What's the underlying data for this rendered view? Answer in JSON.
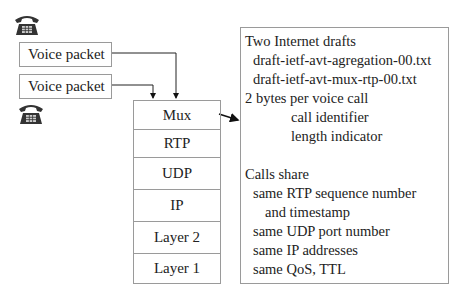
{
  "packets": [
    {
      "label": "Voice packet"
    },
    {
      "label": "Voice packet"
    }
  ],
  "phones": [
    {
      "icon": "telephone-icon"
    },
    {
      "icon": "telephone-icon"
    }
  ],
  "stack": {
    "layers": [
      "Mux",
      "RTP",
      "UDP",
      "IP",
      "Layer 2",
      "Layer 1"
    ]
  },
  "info": {
    "lines": [
      {
        "text": "Two Internet drafts",
        "indent": 0
      },
      {
        "text": "draft-ietf-avt-agregation-00.txt",
        "indent": 8
      },
      {
        "text": "draft-ietf-avt-mux-rtp-00.txt",
        "indent": 8
      },
      {
        "text": "2 bytes per voice call",
        "indent": 0
      },
      {
        "text": "call identifier",
        "indent": 46
      },
      {
        "text": "length indicator",
        "indent": 46
      },
      {
        "text": "",
        "indent": 0
      },
      {
        "text": "Calls share",
        "indent": 0
      },
      {
        "text": "same RTP sequence number",
        "indent": 8
      },
      {
        "text": "and timestamp",
        "indent": 20
      },
      {
        "text": "same UDP port number",
        "indent": 8
      },
      {
        "text": "same IP addresses",
        "indent": 8
      },
      {
        "text": "same QoS, TTL",
        "indent": 8
      }
    ]
  }
}
